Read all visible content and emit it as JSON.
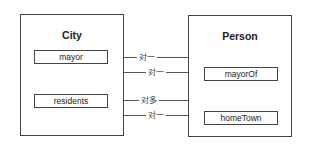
{
  "entities": {
    "city": {
      "title": "City",
      "fields": [
        "mayor",
        "residents"
      ]
    },
    "person": {
      "title": "Person",
      "fields": [
        "mayorOf",
        "homeTown"
      ]
    }
  },
  "relations": [
    {
      "from": "City.mayor",
      "to": "Person",
      "label": "对一"
    },
    {
      "from": "City",
      "to": "Person.mayorOf",
      "label": "对一"
    },
    {
      "from": "City.residents",
      "to": "Person",
      "label": "对多"
    },
    {
      "from": "City",
      "to": "Person.homeTown",
      "label": "对一"
    }
  ]
}
